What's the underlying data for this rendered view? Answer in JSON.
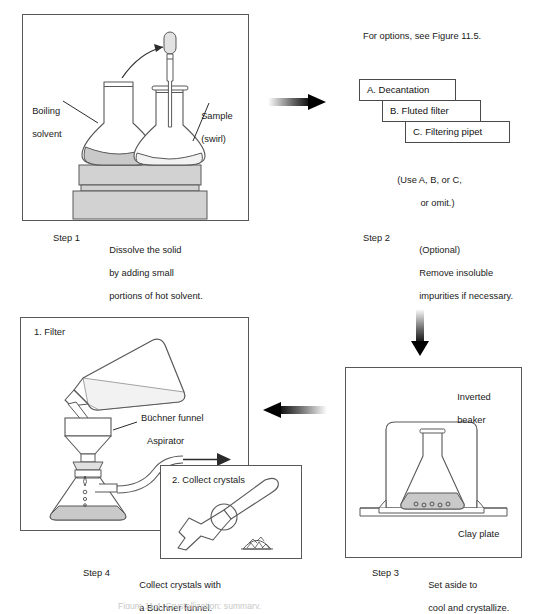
{
  "figure": {
    "title_fragment": "Figure 11.4  Crystallization: summary.",
    "arrows": {
      "step1_to_step2": "arrow-right",
      "step2_to_step3": "arrow-down",
      "step3_to_step4": "arrow-left"
    }
  },
  "step1": {
    "step_label": "Step 1",
    "description_line1": "Dissolve the solid",
    "description_line2": "by adding small",
    "description_line3": "portions of hot solvent.",
    "labels": {
      "left_line1": "Boiling",
      "left_line2": "solvent",
      "right_line1": "Sample",
      "right_line2": "(swirl)"
    }
  },
  "step2": {
    "step_label": "Step 2",
    "description_line1": "(Optional)",
    "description_line2": "Remove insoluble",
    "description_line3": "impurities if necessary.",
    "note": "For options, see Figure 11.5.",
    "options": [
      "A. Decantation",
      "B. Fluted filter",
      "C. Filtering pipet"
    ],
    "usage_line1": "(Use A, B, or C,",
    "usage_line2": "or omit.)"
  },
  "step3": {
    "step_label": "Step 3",
    "description_line1": "Set aside to",
    "description_line2": "cool and crystallize.",
    "labels": {
      "beaker_line1": "Inverted",
      "beaker_line2": "beaker",
      "plate": "Clay plate"
    }
  },
  "step4": {
    "step_label": "Step 4",
    "description_line1": "Collect crystals with",
    "description_line2": "a Büchner funnel.",
    "panel_title": "1. Filter",
    "inset_title": "2. Collect crystals",
    "labels": {
      "funnel": "Büchner funnel",
      "aspirator": "Aspirator"
    }
  },
  "colors": {
    "line": "#58585a",
    "liquid": "#c9c9c9",
    "block": "#d2d2d2",
    "text": "#1a1a1a"
  }
}
